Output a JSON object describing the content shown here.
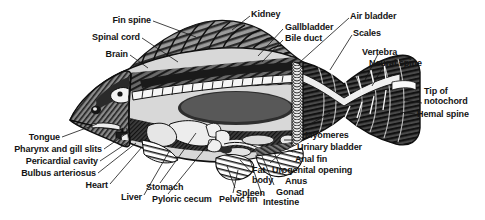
{
  "figure": {
    "style": "black-and-white halftone engraving, cutaway lateral view",
    "background_color": "#ffffff",
    "ink_color": "#141414",
    "orientation": "head at left, tail at right"
  },
  "labels": [
    {
      "id": "fin-spine",
      "text": "Fin spine",
      "x": 151,
      "y": 16,
      "align": "r",
      "leader": [
        [
          153,
          21
        ],
        [
          196,
          37
        ]
      ]
    },
    {
      "id": "spinal-cord",
      "text": "Spinal cord",
      "x": 140,
      "y": 33,
      "align": "r",
      "leader": [
        [
          142,
          38
        ],
        [
          178,
          62
        ]
      ]
    },
    {
      "id": "brain",
      "text": "Brain",
      "x": 128,
      "y": 50,
      "align": "r",
      "leader": [
        [
          130,
          55
        ],
        [
          148,
          68
        ]
      ]
    },
    {
      "id": "kidney",
      "text": "Kidney",
      "x": 251,
      "y": 10,
      "align": "l",
      "leader": [
        [
          250,
          16
        ],
        [
          232,
          30
        ]
      ]
    },
    {
      "id": "gallbladder",
      "text": "Gallbladder",
      "x": 285,
      "y": 23,
      "align": "l",
      "leader": [
        [
          283,
          29
        ],
        [
          258,
          56
        ]
      ]
    },
    {
      "id": "bile-duct",
      "text": "Bile duct",
      "x": 285,
      "y": 34,
      "align": "l",
      "leader": [
        [
          283,
          40
        ],
        [
          262,
          62
        ]
      ]
    },
    {
      "id": "air-bladder",
      "text": "Air bladder",
      "x": 350,
      "y": 12,
      "align": "l",
      "leader": [
        [
          349,
          18
        ],
        [
          300,
          62
        ]
      ]
    },
    {
      "id": "scales",
      "text": "Scales",
      "x": 353,
      "y": 29,
      "align": "l",
      "leader": [
        [
          352,
          35
        ],
        [
          330,
          70
        ]
      ]
    },
    {
      "id": "vertebra",
      "text": "Vertebra",
      "x": 362,
      "y": 48,
      "align": "l",
      "leader": [
        [
          378,
          54
        ],
        [
          364,
          82
        ]
      ]
    },
    {
      "id": "neural-spine",
      "text": "Neural spine",
      "x": 369,
      "y": 59,
      "align": "l",
      "leader": [
        [
          384,
          65
        ],
        [
          372,
          86
        ]
      ]
    },
    {
      "id": "tip-of-notochord",
      "text": "Tip of\nnotochord",
      "x": 424,
      "y": 87,
      "align": "l",
      "leader": [
        [
          422,
          103
        ],
        [
          404,
          100
        ]
      ]
    },
    {
      "id": "hemal-spine",
      "text": "Hemal spine",
      "x": 417,
      "y": 110,
      "align": "l",
      "leader": [
        [
          415,
          114
        ],
        [
          400,
          112
        ]
      ]
    },
    {
      "id": "tongue",
      "text": "Tongue",
      "x": 60,
      "y": 133,
      "align": "r",
      "leader": [
        [
          62,
          137
        ],
        [
          97,
          124
        ]
      ]
    },
    {
      "id": "pharynx-gill-slits",
      "text": "Pharynx and gill slits",
      "x": 102,
      "y": 145,
      "align": "r",
      "leader": [
        [
          104,
          149
        ],
        [
          130,
          131
        ]
      ]
    },
    {
      "id": "pericardial-cavity",
      "text": "Pericardial cavity",
      "x": 98,
      "y": 157,
      "align": "r",
      "leader": [
        [
          100,
          161
        ],
        [
          133,
          139
        ]
      ]
    },
    {
      "id": "bulbus-arteriosus",
      "text": "Bulbus arteriosus",
      "x": 96,
      "y": 169,
      "align": "r",
      "leader": [
        [
          98,
          173
        ],
        [
          136,
          143
        ]
      ]
    },
    {
      "id": "heart",
      "text": "Heart",
      "x": 108,
      "y": 181,
      "align": "r",
      "leader": [
        [
          110,
          184
        ],
        [
          142,
          147
        ]
      ]
    },
    {
      "id": "liver",
      "text": "Liver",
      "x": 142,
      "y": 193,
      "align": "r",
      "leader": [
        [
          144,
          195
        ],
        [
          170,
          150
        ]
      ]
    },
    {
      "id": "stomach",
      "text": "Stomach",
      "x": 146,
      "y": 183,
      "align": "l",
      "leader": [
        [
          160,
          183
        ],
        [
          196,
          133
        ]
      ]
    },
    {
      "id": "pyloric-cecum",
      "text": "Pyloric cecum",
      "x": 152,
      "y": 195,
      "align": "l",
      "leader": [
        [
          168,
          194
        ],
        [
          212,
          140
        ]
      ]
    },
    {
      "id": "pelvic-fin",
      "text": "Pelvic fin",
      "x": 219,
      "y": 195,
      "align": "l",
      "leader": [
        [
          233,
          193
        ],
        [
          238,
          170
        ]
      ]
    },
    {
      "id": "fat-body",
      "text": "Fat\nbody",
      "x": 252,
      "y": 166,
      "align": "l",
      "leader": [
        [
          251,
          172
        ],
        [
          240,
          160
        ]
      ]
    },
    {
      "id": "spleen",
      "text": "Spleen",
      "x": 236,
      "y": 189,
      "align": "l",
      "leader": [
        [
          235,
          188
        ],
        [
          227,
          166
        ]
      ]
    },
    {
      "id": "intestine",
      "text": "Intestine",
      "x": 263,
      "y": 198,
      "align": "l",
      "leader": [
        [
          262,
          195
        ],
        [
          250,
          160
        ]
      ]
    },
    {
      "id": "gonad",
      "text": "Gonad",
      "x": 276,
      "y": 188,
      "align": "l",
      "leader": [
        [
          274,
          185
        ],
        [
          262,
          156
        ]
      ]
    },
    {
      "id": "anus",
      "text": "Anus",
      "x": 285,
      "y": 177,
      "align": "l",
      "leader": [
        [
          283,
          174
        ],
        [
          274,
          152
        ]
      ]
    },
    {
      "id": "urogenital-opening",
      "text": "Urogenital opening",
      "x": 272,
      "y": 166,
      "align": "l",
      "leader": [
        [
          270,
          163
        ],
        [
          282,
          152
        ]
      ]
    },
    {
      "id": "anal-fin",
      "text": "Anal fin",
      "x": 295,
      "y": 155,
      "align": "l",
      "leader": [
        [
          293,
          152
        ],
        [
          283,
          148
        ]
      ]
    },
    {
      "id": "urinary-bladder",
      "text": "Urinary bladder",
      "x": 297,
      "y": 143,
      "align": "l",
      "leader": [
        [
          295,
          140
        ],
        [
          284,
          140
        ]
      ]
    },
    {
      "id": "myomeres",
      "text": "Myomeres",
      "x": 305,
      "y": 131,
      "align": "l",
      "leader": [
        [
          303,
          128
        ],
        [
          330,
          113
        ]
      ]
    }
  ]
}
